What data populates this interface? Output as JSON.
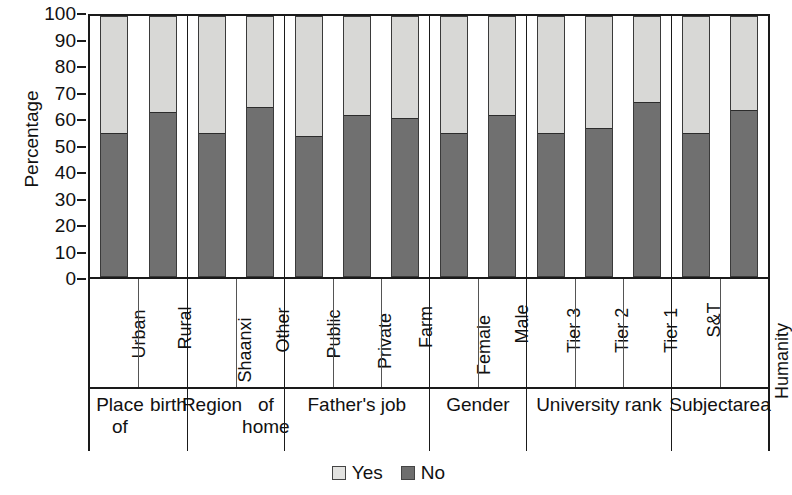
{
  "chart_data": {
    "type": "bar",
    "subtype": "stacked-100-percent",
    "title": "",
    "xlabel": "",
    "ylabel": "Percentage",
    "ylim": [
      0,
      100
    ],
    "yticks": [
      0,
      10,
      20,
      30,
      40,
      50,
      60,
      70,
      80,
      90,
      100
    ],
    "grid": false,
    "legend_position": "bottom-center",
    "legend": [
      "Yes",
      "No"
    ],
    "categories": [
      "Urban",
      "Rural",
      "Shaanxi",
      "Other",
      "Public",
      "Private",
      "Farm",
      "Female",
      "Male",
      "Tier 3",
      "Tier 2",
      "Tier 1",
      "S&T",
      "Humanity"
    ],
    "series": [
      {
        "name": "Yes",
        "color": "#d8d8d6",
        "values": [
          45,
          37,
          45,
          35,
          46,
          38,
          39,
          45,
          38,
          45,
          43,
          33,
          45,
          36
        ]
      },
      {
        "name": "No",
        "color": "#707070",
        "values": [
          55,
          63,
          55,
          65,
          54,
          62,
          61,
          55,
          62,
          55,
          57,
          67,
          55,
          64
        ]
      }
    ],
    "groups": [
      {
        "label": "Place of birth",
        "label_lines": [
          "Place of",
          "birth"
        ],
        "categories": [
          "Urban",
          "Rural"
        ]
      },
      {
        "label": "Region of home",
        "label_lines": [
          "Region",
          "of home"
        ],
        "categories": [
          "Shaanxi",
          "Other"
        ]
      },
      {
        "label": "Father's job",
        "label_lines": [
          "Father's job"
        ],
        "categories": [
          "Public",
          "Private",
          "Farm"
        ]
      },
      {
        "label": "Gender",
        "label_lines": [
          "Gender"
        ],
        "categories": [
          "Female",
          "Male"
        ]
      },
      {
        "label": "University rank",
        "label_lines": [
          "University rank"
        ],
        "categories": [
          "Tier 3",
          "Tier 2",
          "Tier 1"
        ]
      },
      {
        "label": "Subject area",
        "label_lines": [
          "Subject",
          "area"
        ],
        "categories": [
          "S&T",
          "Humanity"
        ]
      }
    ]
  },
  "axis": {
    "y_title": "Percentage",
    "y_ticks": [
      "100",
      "90",
      "80",
      "70",
      "60",
      "50",
      "40",
      "30",
      "20",
      "10",
      "0"
    ]
  },
  "legend": {
    "items": [
      {
        "label": "Yes",
        "swatch": "light-square-swatch"
      },
      {
        "label": "No",
        "swatch": "dark-square-swatch"
      }
    ]
  }
}
